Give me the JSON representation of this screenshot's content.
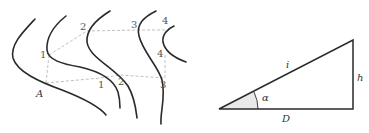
{
  "figure": {
    "contour_map": {
      "contour_count": 5,
      "point_labels": {
        "upper_1": "1",
        "upper_2": "2",
        "upper_3": "3",
        "upper_4": "4",
        "right_4": "4",
        "lower_1": "1",
        "lower_2": "2",
        "lower_3": "3",
        "start": "A"
      },
      "colors": {
        "contour_line": "#2a2a2a",
        "dashed_path": "#b9b9b9",
        "label": "#555555"
      }
    },
    "triangle": {
      "hypotenuse_label": "i",
      "height_label": "h",
      "angle_label": "α",
      "base_label": "D",
      "colors": {
        "edge": "#2a2a2a",
        "angle_fill": "#e9e9e9"
      }
    }
  }
}
